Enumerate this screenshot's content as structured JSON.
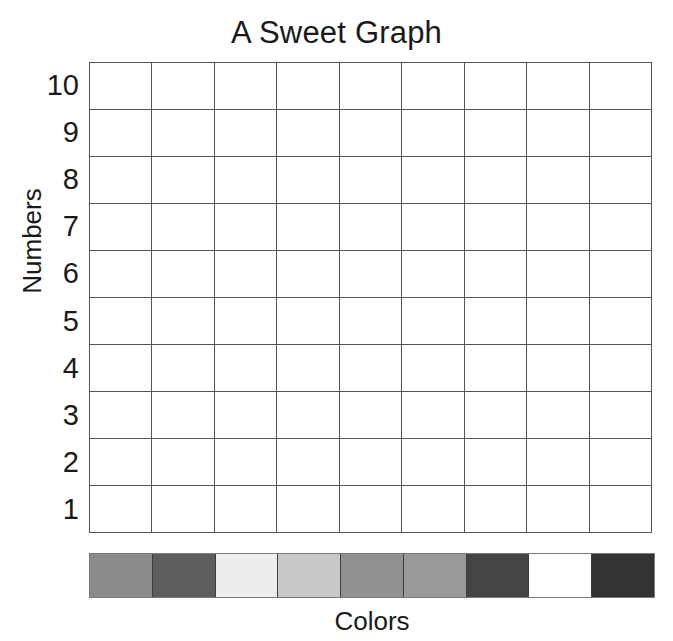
{
  "chart_data": {
    "type": "table",
    "title": "A Sweet Graph",
    "xlabel": "Colors",
    "ylabel": "Numbers",
    "grid": true,
    "legend": "none",
    "columns": 9,
    "rows": 10,
    "y_ticks": [
      "10",
      "9",
      "8",
      "7",
      "6",
      "5",
      "4",
      "3",
      "2",
      "1"
    ],
    "ylim": [
      0,
      10
    ],
    "x_categories": [
      "color-1",
      "color-2",
      "color-3",
      "color-4",
      "color-5",
      "color-6",
      "color-7",
      "color-8",
      "color-9"
    ],
    "x_swatch_colors": [
      "#8a8a8a",
      "#5d5d5d",
      "#ededed",
      "#c8c8c8",
      "#919191",
      "#9a9a9a",
      "#444444",
      "#ffffff",
      "#333333"
    ],
    "values": [
      [
        null,
        null,
        null,
        null,
        null,
        null,
        null,
        null,
        null
      ],
      [
        null,
        null,
        null,
        null,
        null,
        null,
        null,
        null,
        null
      ],
      [
        null,
        null,
        null,
        null,
        null,
        null,
        null,
        null,
        null
      ],
      [
        null,
        null,
        null,
        null,
        null,
        null,
        null,
        null,
        null
      ],
      [
        null,
        null,
        null,
        null,
        null,
        null,
        null,
        null,
        null
      ],
      [
        null,
        null,
        null,
        null,
        null,
        null,
        null,
        null,
        null
      ],
      [
        null,
        null,
        null,
        null,
        null,
        null,
        null,
        null,
        null
      ],
      [
        null,
        null,
        null,
        null,
        null,
        null,
        null,
        null,
        null
      ],
      [
        null,
        null,
        null,
        null,
        null,
        null,
        null,
        null,
        null
      ],
      [
        null,
        null,
        null,
        null,
        null,
        null,
        null,
        null,
        null
      ]
    ],
    "annotation": "blank worksheet grid; no data plotted"
  },
  "title": "A Sweet Graph",
  "axes": {
    "y_label": "Numbers",
    "x_label": "Colors",
    "y_ticks": [
      "10",
      "9",
      "8",
      "7",
      "6",
      "5",
      "4",
      "3",
      "2",
      "1"
    ]
  },
  "swatches": [
    {
      "name": "swatch-1",
      "color": "#8a8a8a"
    },
    {
      "name": "swatch-2",
      "color": "#5d5d5d"
    },
    {
      "name": "swatch-3",
      "color": "#ededed"
    },
    {
      "name": "swatch-4",
      "color": "#c8c8c8"
    },
    {
      "name": "swatch-5",
      "color": "#919191"
    },
    {
      "name": "swatch-6",
      "color": "#9a9a9a"
    },
    {
      "name": "swatch-7",
      "color": "#444444"
    },
    {
      "name": "swatch-8",
      "color": "#ffffff"
    },
    {
      "name": "swatch-9",
      "color": "#333333"
    }
  ],
  "style": {
    "grid_line_color": "#555555",
    "text_color": "#1a1a1a",
    "background": "#ffffff",
    "swatch_border_color": "#3d3d3d"
  },
  "watermark": {
    "text": ""
  }
}
